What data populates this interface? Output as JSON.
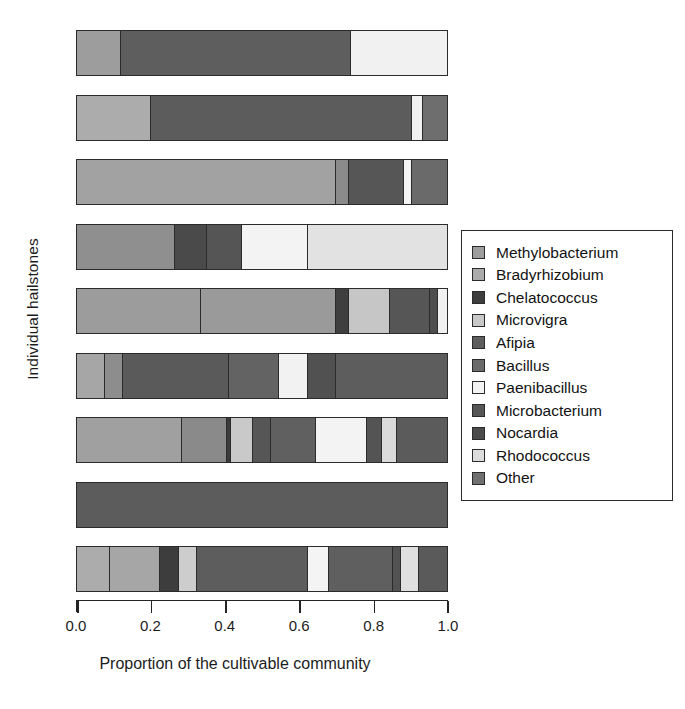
{
  "axes": {
    "ylabel": "Individual hailstones",
    "xlabel": "Proportion of the cultivable community",
    "xticks": [
      "0.0",
      "0.2",
      "0.4",
      "0.6",
      "0.8",
      "1.0"
    ]
  },
  "legend": {
    "items": [
      {
        "label": "Methylobacterium",
        "color": "#9d9d9d"
      },
      {
        "label": "Bradyrhizobium",
        "color": "#ababab"
      },
      {
        "label": "Chelatococcus",
        "color": "#3e3e3e"
      },
      {
        "label": "Microvigra",
        "color": "#c8c8c8"
      },
      {
        "label": "Afipia",
        "color": "#5e5e5e"
      },
      {
        "label": "Bacillus",
        "color": "#6b6b6b"
      },
      {
        "label": "Paenibacillus",
        "color": "#f3f3f3"
      },
      {
        "label": "Microbacterium",
        "color": "#565656"
      },
      {
        "label": "Nocardia",
        "color": "#4a4a4a"
      },
      {
        "label": "Rhodococcus",
        "color": "#dcdcdc"
      },
      {
        "label": "Other",
        "color": "#707070"
      }
    ]
  },
  "chart_data": {
    "type": "bar",
    "orientation": "horizontal",
    "stacked": true,
    "title": "",
    "xlabel": "Proportion of the cultivable community",
    "ylabel": "Individual hailstones",
    "xlim": [
      0.0,
      1.0
    ],
    "grid": false,
    "legend_position": "right",
    "categories": [
      "Hailstone 1",
      "Hailstone 2",
      "Hailstone 3",
      "Hailstone 4",
      "Hailstone 5",
      "Hailstone 6",
      "Hailstone 7",
      "Hailstone 8",
      "Hailstone 9"
    ],
    "taxa": [
      "Methylobacterium",
      "Bradyrhizobium",
      "Chelatococcus",
      "Microvigra",
      "Afipia",
      "Bacillus",
      "Paenibacillus",
      "Microbacterium",
      "Nocardia",
      "Rhodococcus",
      "Other"
    ],
    "bars": [
      {
        "category": "Hailstone 1",
        "segments": [
          {
            "taxon": "Methylobacterium",
            "value": 0.12,
            "color": "#9d9d9d"
          },
          {
            "taxon": "Afipia",
            "value": 0.62,
            "color": "#5e5e5e"
          },
          {
            "taxon": "Paenibacillus",
            "value": 0.26,
            "color": "#f1f1f1"
          }
        ]
      },
      {
        "category": "Hailstone 2",
        "segments": [
          {
            "taxon": "Methylobacterium",
            "value": 0.2,
            "color": "#acacac"
          },
          {
            "taxon": "Afipia",
            "value": 0.705,
            "color": "#5c5c5c"
          },
          {
            "taxon": "Paenibacillus",
            "value": 0.03,
            "color": "#f1f1f1"
          },
          {
            "taxon": "Other",
            "value": 0.065,
            "color": "#6e6e6e"
          }
        ]
      },
      {
        "category": "Hailstone 3",
        "segments": [
          {
            "taxon": "Methylobacterium",
            "value": 0.7,
            "color": "#a2a2a2"
          },
          {
            "taxon": "Bradyrhizobium",
            "value": 0.035,
            "color": "#8b8b8b"
          },
          {
            "taxon": "Afipia",
            "value": 0.15,
            "color": "#565656"
          },
          {
            "taxon": "Paenibacillus",
            "value": 0.02,
            "color": "#f4f4f4"
          },
          {
            "taxon": "Other",
            "value": 0.095,
            "color": "#6a6a6a"
          }
        ]
      },
      {
        "category": "Hailstone 4",
        "segments": [
          {
            "taxon": "Methylobacterium",
            "value": 0.265,
            "color": "#8f8f8f"
          },
          {
            "taxon": "Chelatococcus",
            "value": 0.085,
            "color": "#4a4a4a"
          },
          {
            "taxon": "Afipia",
            "value": 0.095,
            "color": "#555555"
          },
          {
            "taxon": "Paenibacillus",
            "value": 0.18,
            "color": "#f3f3f3"
          },
          {
            "taxon": "Rhodococcus",
            "value": 0.375,
            "color": "#e2e2e2"
          }
        ]
      },
      {
        "category": "Hailstone 5",
        "segments": [
          {
            "taxon": "Methylobacterium",
            "value": 0.335,
            "color": "#9c9c9c"
          },
          {
            "taxon": "Bradyrhizobium",
            "value": 0.365,
            "color": "#9a9a9a"
          },
          {
            "taxon": "Chelatococcus",
            "value": 0.035,
            "color": "#3f3f3f"
          },
          {
            "taxon": "Microvigra",
            "value": 0.11,
            "color": "#c6c6c6"
          },
          {
            "taxon": "Microbacterium",
            "value": 0.11,
            "color": "#565656"
          },
          {
            "taxon": "Nocardia",
            "value": 0.02,
            "color": "#4d4d4d"
          },
          {
            "taxon": "Paenibacillus",
            "value": 0.025,
            "color": "#f0f0f0"
          }
        ]
      },
      {
        "category": "Hailstone 6",
        "segments": [
          {
            "taxon": "Methylobacterium",
            "value": 0.075,
            "color": "#a6a6a6"
          },
          {
            "taxon": "Bradyrhizobium",
            "value": 0.05,
            "color": "#8d8d8d"
          },
          {
            "taxon": "Afipia",
            "value": 0.285,
            "color": "#5a5a5a"
          },
          {
            "taxon": "Bacillus",
            "value": 0.135,
            "color": "#636363"
          },
          {
            "taxon": "Paenibacillus",
            "value": 0.08,
            "color": "#f2f2f2"
          },
          {
            "taxon": "Microbacterium",
            "value": 0.075,
            "color": "#515151"
          },
          {
            "taxon": "Other",
            "value": 0.3,
            "color": "#5d5d5d"
          }
        ]
      },
      {
        "category": "Hailstone 7",
        "segments": [
          {
            "taxon": "Methylobacterium",
            "value": 0.285,
            "color": "#a0a0a0"
          },
          {
            "taxon": "Bradyrhizobium",
            "value": 0.12,
            "color": "#8a8a8a"
          },
          {
            "taxon": "Chelatococcus",
            "value": 0.01,
            "color": "#3b3b3b"
          },
          {
            "taxon": "Microvigra",
            "value": 0.06,
            "color": "#c9c9c9"
          },
          {
            "taxon": "Afipia",
            "value": 0.05,
            "color": "#565656"
          },
          {
            "taxon": "Bacillus",
            "value": 0.12,
            "color": "#606060"
          },
          {
            "taxon": "Paenibacillus",
            "value": 0.14,
            "color": "#f3f3f3"
          },
          {
            "taxon": "Microbacterium",
            "value": 0.04,
            "color": "#545454"
          },
          {
            "taxon": "Rhodococcus",
            "value": 0.04,
            "color": "#dadada"
          },
          {
            "taxon": "Other",
            "value": 0.135,
            "color": "#5b5b5b"
          }
        ]
      },
      {
        "category": "Hailstone 8",
        "segments": [
          {
            "taxon": "Afipia",
            "value": 1.0,
            "color": "#5c5c5c"
          }
        ]
      },
      {
        "category": "Hailstone 9",
        "segments": [
          {
            "taxon": "Methylobacterium",
            "value": 0.09,
            "color": "#acacac"
          },
          {
            "taxon": "Bradyrhizobium",
            "value": 0.135,
            "color": "#a6a6a6"
          },
          {
            "taxon": "Chelatococcus",
            "value": 0.05,
            "color": "#3d3d3d"
          },
          {
            "taxon": "Microvigra",
            "value": 0.05,
            "color": "#cdcdcd"
          },
          {
            "taxon": "Afipia",
            "value": 0.3,
            "color": "#5d5d5d"
          },
          {
            "taxon": "Paenibacillus",
            "value": 0.055,
            "color": "#f4f4f4"
          },
          {
            "taxon": "Bacillus",
            "value": 0.175,
            "color": "#5f5f5f"
          },
          {
            "taxon": "Microbacterium",
            "value": 0.02,
            "color": "#525252"
          },
          {
            "taxon": "Rhodococcus",
            "value": 0.05,
            "color": "#dfdfdf"
          },
          {
            "taxon": "Other",
            "value": 0.075,
            "color": "#5a5a5a"
          }
        ]
      }
    ]
  }
}
